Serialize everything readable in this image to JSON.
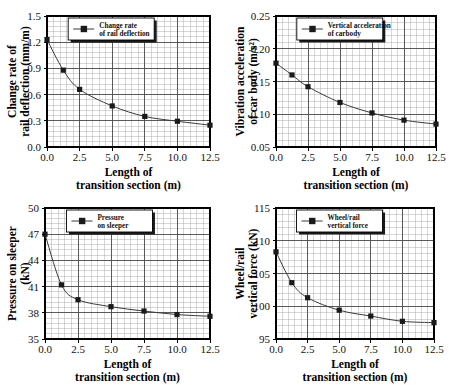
{
  "figure": {
    "panel_count": 4,
    "background": "#ffffff",
    "line_color": "#3a3a3a",
    "marker_color": "#1a1a1a",
    "grid_major_color": "#4d4d4d",
    "grid_minor_color": "#9a9a9a",
    "axis_color": "#000000"
  },
  "shared": {
    "xlabel_line1": "Length of",
    "xlabel_line2": "transition section (m)",
    "xticks": [
      "0.0",
      "2.5",
      "5.0",
      "7.5",
      "10.0",
      "12.5"
    ],
    "xlim": [
      0,
      12.5
    ]
  },
  "panels": [
    {
      "id": "panel-change-rate-rail-deflection",
      "legend_line1": "Change rate",
      "legend_line2": "of rail deflection",
      "ylabel_line1": "Change rate of",
      "ylabel_line2": "rail deflection (mm/m)",
      "yticks": [
        "0.0",
        "0.3",
        "0.6",
        "0.9",
        "1.2",
        "1.5"
      ],
      "chart_data": {
        "type": "line",
        "title": "",
        "xlabel": "Length of transition section (m)",
        "ylabel": "Change rate of rail deflection (mm/m)",
        "xlim": [
          0,
          12.5
        ],
        "ylim": [
          0.0,
          1.5
        ],
        "xticks": [
          0.0,
          2.5,
          5.0,
          7.5,
          10.0,
          12.5
        ],
        "yticks": [
          0.0,
          0.3,
          0.6,
          0.9,
          1.2,
          1.5
        ],
        "grid": true,
        "minor_grid": true,
        "legend": "Change rate of rail deflection",
        "legend_position": "top-center",
        "marker": "square",
        "series": [
          {
            "name": "Change rate of rail deflection",
            "x": [
              0,
              1.25,
              2.5,
              5.0,
              7.5,
              10.0,
              12.5
            ],
            "y": [
              1.23,
              0.88,
              0.66,
              0.47,
              0.35,
              0.295,
              0.25
            ]
          }
        ]
      }
    },
    {
      "id": "panel-vibration-acceleration-car-body",
      "legend_line1": "Vertical acceleration",
      "legend_line2": "of carbody",
      "ylabel_line1": "Vibration acceleration",
      "ylabel_line2": "of car body (m/s²)",
      "yticks": [
        "0.05",
        "0.10",
        "0.15",
        "0.20",
        "0.25"
      ],
      "chart_data": {
        "type": "line",
        "title": "",
        "xlabel": "Length of transition section (m)",
        "ylabel": "Vibration acceleration of car body (m/s²)",
        "xlim": [
          0,
          12.5
        ],
        "ylim": [
          0.05,
          0.25
        ],
        "xticks": [
          0.0,
          2.5,
          5.0,
          7.5,
          10.0,
          12.5
        ],
        "yticks": [
          0.05,
          0.1,
          0.15,
          0.2,
          0.25
        ],
        "grid": true,
        "minor_grid": true,
        "legend": "Vertical acceleration of carbody",
        "legend_position": "top-center",
        "marker": "square",
        "series": [
          {
            "name": "Vertical acceleration of carbody",
            "x": [
              0,
              1.25,
              2.5,
              5.0,
              7.5,
              10.0,
              12.5
            ],
            "y": [
              0.178,
              0.16,
              0.142,
              0.118,
              0.102,
              0.091,
              0.085
            ]
          }
        ]
      }
    },
    {
      "id": "panel-pressure-on-sleeper",
      "legend_line1": "Pressure",
      "legend_line2": "on sleeper",
      "ylabel_line1": "Pressure on sleeper",
      "ylabel_line2": "(kN)",
      "yticks": [
        "35",
        "38",
        "41",
        "44",
        "47",
        "50"
      ],
      "chart_data": {
        "type": "line",
        "title": "",
        "xlabel": "Length of transition section (m)",
        "ylabel": "Pressure on sleeper (kN)",
        "xlim": [
          0,
          12.5
        ],
        "ylim": [
          35,
          50
        ],
        "xticks": [
          0.0,
          2.5,
          5.0,
          7.5,
          10.0,
          12.5
        ],
        "yticks": [
          35,
          38,
          41,
          44,
          47,
          50
        ],
        "grid": true,
        "minor_grid": true,
        "legend": "Pressure on sleeper",
        "legend_position": "top-center",
        "marker": "square",
        "series": [
          {
            "name": "Pressure on sleeper",
            "x": [
              0,
              1.25,
              2.5,
              5.0,
              7.5,
              10.0,
              12.5
            ],
            "y": [
              47.0,
              41.2,
              39.5,
              38.7,
              38.2,
              37.8,
              37.6
            ]
          }
        ]
      }
    },
    {
      "id": "panel-wheel-rail-vertical-force",
      "legend_line1": "Wheel/rail",
      "legend_line2": "vertical force",
      "ylabel_line1": "Wheel/rail",
      "ylabel_line2": "vertical force (kN)",
      "yticks": [
        "95",
        "100",
        "105",
        "110",
        "115"
      ],
      "chart_data": {
        "type": "line",
        "title": "",
        "xlabel": "Length of transition section (m)",
        "ylabel": "Wheel/rail vertical force (kN)",
        "xlim": [
          0,
          12.5
        ],
        "ylim": [
          95,
          115
        ],
        "xticks": [
          0.0,
          2.5,
          5.0,
          7.5,
          10.0,
          12.5
        ],
        "yticks": [
          95,
          100,
          105,
          110,
          115
        ],
        "grid": true,
        "minor_grid": true,
        "legend": "Wheel/rail vertical force",
        "legend_position": "top-center",
        "marker": "square",
        "series": [
          {
            "name": "Wheel/rail vertical force",
            "x": [
              0,
              1.25,
              2.5,
              5.0,
              7.5,
              10.0,
              12.5
            ],
            "y": [
              108.3,
              103.6,
              101.3,
              99.4,
              98.5,
              97.7,
              97.5
            ]
          }
        ]
      }
    }
  ]
}
